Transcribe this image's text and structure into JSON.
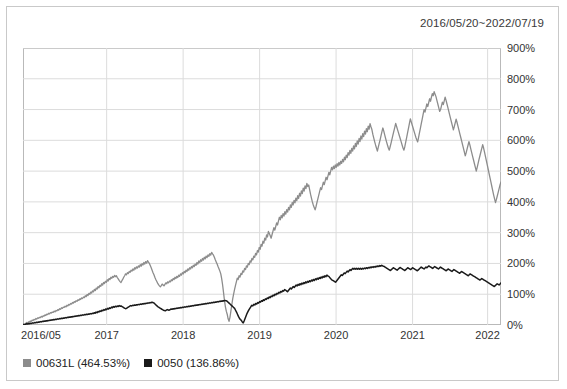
{
  "card": {
    "title": "2016/05/20~2022/07/19"
  },
  "legend": [
    {
      "label": "00631L (464.53%)",
      "color": "#8c8c8c",
      "name": "legend-item-00631l"
    },
    {
      "label": "0050 (136.86%)",
      "color": "#1a1a1a",
      "name": "legend-item-0050"
    }
  ],
  "axis": {
    "y_ticks": [
      "0%",
      "100%",
      "200%",
      "300%",
      "400%",
      "500%",
      "600%",
      "700%",
      "800%",
      "900%"
    ],
    "x_ticks": [
      "2016/05",
      "2017",
      "2018",
      "2019",
      "2020",
      "2021",
      "2022"
    ]
  },
  "chart_data": {
    "type": "line",
    "title": "2016/05/20~2022/07/19",
    "xlabel": "",
    "ylabel": "",
    "ylim": [
      0,
      900
    ],
    "yunit": "%",
    "grid": true,
    "legend_position": "bottom-left",
    "y_ticks": [
      0,
      100,
      200,
      300,
      400,
      500,
      600,
      700,
      800,
      900
    ],
    "x_ticks": [
      "2016/05",
      "2017",
      "2018",
      "2019",
      "2020",
      "2021",
      "2022"
    ],
    "x_tick_positions": [
      0.0,
      0.175,
      0.335,
      0.495,
      0.655,
      0.815,
      0.972
    ],
    "series": [
      {
        "name": "00631L",
        "final_return_pct": 464.53,
        "color": "#8c8c8c",
        "values": [
          0,
          3,
          1,
          5,
          8,
          6,
          10,
          9,
          13,
          12,
          16,
          14,
          18,
          17,
          21,
          19,
          23,
          22,
          25,
          24,
          28,
          26,
          30,
          29,
          33,
          31,
          35,
          34,
          38,
          36,
          40,
          39,
          42,
          41,
          45,
          43,
          47,
          46,
          50,
          48,
          53,
          51,
          56,
          54,
          58,
          57,
          61,
          59,
          64,
          62,
          67,
          65,
          70,
          68,
          73,
          71,
          76,
          74,
          79,
          77,
          82,
          80,
          85,
          83,
          88,
          86,
          91,
          89,
          95,
          92,
          99,
          96,
          103,
          100,
          107,
          104,
          111,
          108,
          116,
          112,
          120,
          117,
          125,
          121,
          129,
          126,
          134,
          130,
          138,
          135,
          142,
          139,
          147,
          143,
          151,
          148,
          155,
          152,
          158,
          155,
          161,
          157,
          160,
          154,
          150,
          145,
          141,
          138,
          144,
          149,
          155,
          160,
          166,
          163,
          170,
          167,
          174,
          171,
          178,
          175,
          182,
          178,
          186,
          182,
          189,
          185,
          192,
          188,
          196,
          191,
          199,
          195,
          203,
          198,
          206,
          201,
          209,
          204,
          200,
          193,
          186,
          178,
          170,
          163,
          155,
          148,
          142,
          136,
          131,
          127,
          124,
          128,
          133,
          130,
          127,
          132,
          137,
          134,
          140,
          137,
          143,
          140,
          147,
          144,
          151,
          148,
          155,
          151,
          158,
          154,
          162,
          158,
          166,
          162,
          170,
          166,
          174,
          170,
          178,
          174,
          182,
          178,
          186,
          182,
          190,
          186,
          194,
          190,
          198,
          194,
          203,
          198,
          208,
          203,
          212,
          207,
          216,
          211,
          220,
          215,
          224,
          219,
          228,
          223,
          232,
          227,
          236,
          231,
          227,
          220,
          212,
          205,
          198,
          190,
          183,
          175,
          166,
          150,
          130,
          105,
          80,
          60,
          45,
          35,
          20,
          12,
          25,
          45,
          65,
          85,
          100,
          115,
          128,
          140,
          152,
          148,
          160,
          156,
          168,
          164,
          176,
          172,
          184,
          180,
          192,
          188,
          200,
          196,
          208,
          204,
          216,
          212,
          224,
          220,
          233,
          228,
          242,
          237,
          252,
          246,
          262,
          256,
          272,
          266,
          282,
          276,
          293,
          286,
          304,
          297,
          290,
          282,
          294,
          305,
          316,
          308,
          320,
          332,
          325,
          338,
          350,
          342,
          356,
          348,
          362,
          354,
          368,
          360,
          375,
          367,
          382,
          374,
          390,
          382,
          398,
          390,
          405,
          397,
          412,
          404,
          420,
          411,
          428,
          419,
          436,
          427,
          445,
          435,
          452,
          443,
          460,
          450,
          455,
          440,
          425,
          412,
          400,
          390,
          382,
          374,
          385,
          398,
          410,
          422,
          434,
          446,
          440,
          452,
          464,
          456,
          468,
          480,
          472,
          484,
          496,
          488,
          500,
          512,
          504,
          516,
          508,
          520,
          512,
          524,
          516,
          528,
          520,
          532,
          525,
          538,
          530,
          545,
          537,
          552,
          544,
          560,
          552,
          567,
          558,
          574,
          565,
          582,
          572,
          590,
          580,
          598,
          588,
          606,
          596,
          614,
          604,
          622,
          612,
          630,
          620,
          638,
          628,
          646,
          636,
          654,
          644,
          635,
          620,
          608,
          596,
          585,
          575,
          565,
          578,
          590,
          602,
          615,
          628,
          640,
          630,
          618,
          606,
          595,
          585,
          575,
          568,
          580,
          592,
          605,
          618,
          630,
          642,
          655,
          645,
          635,
          625,
          615,
          605,
          595,
          585,
          575,
          568,
          580,
          595,
          610,
          625,
          640,
          655,
          670,
          660,
          650,
          640,
          630,
          620,
          610,
          602,
          595,
          610,
          625,
          640,
          655,
          670,
          685,
          700,
          692,
          705,
          718,
          710,
          722,
          735,
          727,
          740,
          752,
          745,
          758,
          750,
          742,
          730,
          718,
          706,
          694,
          700,
          712,
          724,
          716,
          728,
          740,
          730,
          718,
          706,
          694,
          682,
          670,
          658,
          646,
          634,
          645,
          657,
          669,
          658,
          646,
          634,
          622,
          610,
          598,
          586,
          574,
          562,
          550,
          560,
          572,
          584,
          596,
          585,
          572,
          560,
          548,
          536,
          524,
          512,
          500,
          512,
          525,
          538,
          550,
          562,
          574,
          586,
          575,
          562,
          548,
          534,
          520,
          506,
          492,
          478,
          464,
          450,
          436,
          422,
          410,
          398,
          408,
          420,
          432,
          444,
          456,
          464.53
        ]
      },
      {
        "name": "0050",
        "final_return_pct": 136.86,
        "color": "#1a1a1a",
        "values": [
          0,
          2,
          1,
          3,
          4,
          3,
          5,
          4,
          6,
          5,
          7,
          6,
          8,
          7,
          9,
          8,
          10,
          9,
          11,
          10,
          12,
          11,
          13,
          12,
          14,
          13,
          15,
          14,
          16,
          15,
          17,
          16,
          18,
          17,
          19,
          18,
          20,
          19,
          21,
          20,
          22,
          21,
          23,
          22,
          24,
          23,
          25,
          24,
          26,
          25,
          27,
          26,
          28,
          27,
          29,
          28,
          30,
          29,
          31,
          30,
          32,
          31,
          33,
          32,
          34,
          33,
          35,
          34,
          36,
          35,
          37,
          36,
          38,
          37,
          40,
          38,
          42,
          40,
          44,
          42,
          46,
          44,
          48,
          46,
          50,
          48,
          52,
          50,
          54,
          52,
          56,
          54,
          58,
          56,
          60,
          58,
          61,
          59,
          62,
          60,
          63,
          61,
          62,
          60,
          58,
          56,
          54,
          53,
          55,
          57,
          59,
          61,
          63,
          62,
          64,
          63,
          65,
          64,
          66,
          65,
          67,
          66,
          68,
          67,
          69,
          68,
          70,
          69,
          71,
          70,
          72,
          71,
          73,
          72,
          74,
          73,
          72,
          69,
          66,
          63,
          60,
          58,
          56,
          54,
          52,
          50,
          48,
          47,
          46,
          48,
          50,
          49,
          48,
          50,
          52,
          51,
          53,
          52,
          54,
          53,
          55,
          54,
          56,
          55,
          57,
          56,
          58,
          57,
          59,
          58,
          60,
          59,
          61,
          60,
          62,
          61,
          63,
          62,
          64,
          63,
          65,
          64,
          66,
          65,
          67,
          66,
          68,
          67,
          69,
          68,
          70,
          69,
          71,
          70,
          72,
          71,
          73,
          72,
          74,
          73,
          75,
          74,
          76,
          75,
          77,
          76,
          78,
          77,
          79,
          78,
          80,
          79,
          78,
          75,
          72,
          69,
          66,
          63,
          60,
          57,
          54,
          48,
          42,
          35,
          28,
          22,
          18,
          15,
          10,
          7,
          14,
          22,
          30,
          38,
          44,
          50,
          55,
          60,
          64,
          62,
          67,
          65,
          70,
          68,
          73,
          71,
          76,
          74,
          79,
          77,
          82,
          80,
          85,
          83,
          88,
          86,
          91,
          89,
          94,
          92,
          97,
          95,
          100,
          98,
          103,
          101,
          106,
          104,
          109,
          107,
          112,
          110,
          115,
          113,
          111,
          108,
          112,
          116,
          120,
          117,
          121,
          125,
          122,
          126,
          130,
          127,
          132,
          129,
          134,
          131,
          136,
          133,
          138,
          135,
          140,
          137,
          142,
          139,
          144,
          141,
          146,
          143,
          148,
          145,
          150,
          147,
          152,
          149,
          154,
          151,
          156,
          153,
          158,
          155,
          160,
          157,
          162,
          159,
          158,
          154,
          150,
          147,
          145,
          143,
          141,
          139,
          143,
          147,
          151,
          155,
          159,
          163,
          161,
          165,
          169,
          167,
          171,
          175,
          172,
          176,
          180,
          177,
          181,
          184,
          181,
          184,
          181,
          184,
          181,
          184,
          181,
          184,
          181,
          184,
          182,
          185,
          183,
          186,
          184,
          187,
          185,
          188,
          186,
          189,
          187,
          190,
          188,
          191,
          189,
          192,
          190,
          193,
          191,
          194,
          192,
          191,
          189,
          187,
          185,
          183,
          181,
          179,
          177,
          180,
          183,
          186,
          184,
          182,
          180,
          178,
          181,
          184,
          187,
          185,
          183,
          181,
          179,
          177,
          180,
          183,
          186,
          184,
          182,
          180,
          183,
          186,
          184,
          182,
          180,
          178,
          176,
          179,
          182,
          185,
          188,
          186,
          184,
          182,
          185,
          188,
          186,
          189,
          192,
          190,
          188,
          186,
          184,
          187,
          190,
          188,
          186,
          184,
          182,
          185,
          188,
          186,
          184,
          182,
          180,
          178,
          176,
          179,
          182,
          180,
          178,
          176,
          174,
          177,
          180,
          178,
          176,
          174,
          172,
          170,
          168,
          171,
          174,
          172,
          170,
          168,
          166,
          164,
          162,
          160,
          163,
          166,
          164,
          162,
          160,
          158,
          156,
          154,
          152,
          150,
          148,
          146,
          148,
          151,
          149,
          147,
          145,
          143,
          141,
          139,
          137,
          135,
          133,
          131,
          129,
          127,
          125,
          128,
          131,
          134,
          132,
          130,
          133,
          136.86
        ]
      }
    ]
  }
}
